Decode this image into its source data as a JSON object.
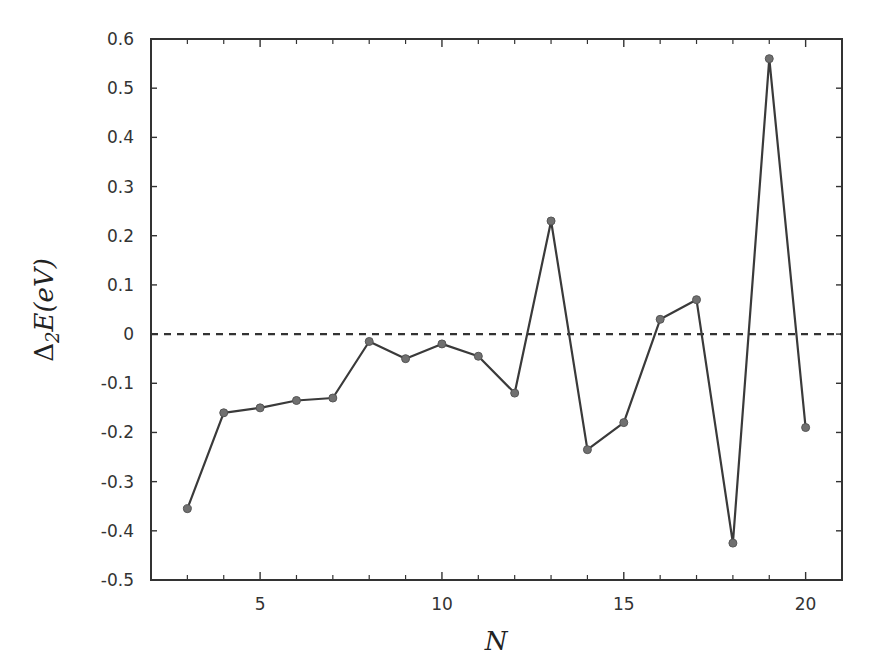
{
  "chart_data": {
    "type": "line",
    "title": "",
    "xlabel": "N",
    "ylabel": "Δ2E(eV)",
    "ylabel_parts": {
      "delta": "Δ",
      "sub": "2",
      "rest": "E(eV)"
    },
    "xlim": [
      2,
      21
    ],
    "ylim": [
      -0.5,
      0.6
    ],
    "x_ticks": [
      5,
      10,
      15,
      20
    ],
    "x_tick_labels": [
      "5",
      "10",
      "15",
      "20"
    ],
    "x_minor_ticks": [
      3,
      4,
      6,
      7,
      8,
      9,
      11,
      12,
      13,
      14,
      16,
      17,
      18,
      19
    ],
    "y_ticks": [
      -0.5,
      -0.4,
      -0.3,
      -0.2,
      -0.1,
      0,
      0.1,
      0.2,
      0.3,
      0.4,
      0.5,
      0.6
    ],
    "y_tick_labels": [
      "-0.5",
      "-0.4",
      "-0.3",
      "-0.2",
      "-0.1",
      "0",
      "0.1",
      "0.2",
      "0.3",
      "0.4",
      "0.5",
      "0.6"
    ],
    "grid": false,
    "legend": null,
    "reference_line": {
      "y": 0,
      "style": "dashed"
    },
    "series": [
      {
        "name": "Δ2E",
        "x": [
          3,
          4,
          5,
          6,
          7,
          8,
          9,
          10,
          11,
          12,
          13,
          14,
          15,
          16,
          17,
          18,
          19,
          20
        ],
        "values": [
          -0.355,
          -0.16,
          -0.15,
          -0.135,
          -0.13,
          -0.015,
          -0.05,
          -0.02,
          -0.045,
          -0.12,
          0.23,
          -0.235,
          -0.18,
          0.03,
          0.07,
          -0.425,
          0.56,
          -0.19
        ],
        "color": "#3a3a3a",
        "marker_color": "#707070"
      }
    ]
  },
  "layout": {
    "plot_left": 151,
    "plot_right": 842,
    "plot_top": 39,
    "plot_bottom": 580
  }
}
